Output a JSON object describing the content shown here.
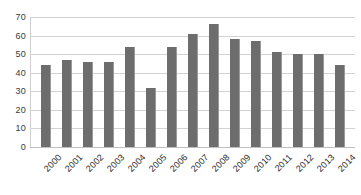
{
  "chart_data": {
    "type": "bar",
    "title": "",
    "subtitle": "",
    "xlabel": "",
    "ylabel": "",
    "categories": [
      "2000",
      "2001",
      "2002",
      "2003",
      "2004",
      "2005",
      "2006",
      "2007",
      "2008",
      "2009",
      "2010",
      "2011",
      "2012",
      "2013",
      "2014"
    ],
    "values": [
      44,
      47,
      46,
      46,
      54,
      32,
      54,
      61,
      66,
      58,
      57,
      51,
      50,
      50,
      44
    ],
    "series": [
      {
        "name": "",
        "values": [
          44,
          47,
          46,
          46,
          54,
          32,
          54,
          61,
          66,
          58,
          57,
          51,
          50,
          50,
          44
        ]
      }
    ],
    "ylim": [
      0,
      70
    ],
    "ytick_labels": [
      "70",
      "60",
      "50",
      "40",
      "30",
      "20",
      "10",
      "0"
    ],
    "ytick_values": [
      70,
      60,
      50,
      40,
      30,
      20,
      10,
      0
    ],
    "grid": true,
    "grid_axis": "y",
    "legend": false,
    "legend_position": "none",
    "annotations": [],
    "bar_color": "#6d6d6d",
    "grid_color": "#d3d3d3",
    "background_color": "#ffffff",
    "axis_text_color": "#2d2d2d",
    "xtick_rotation": -45
  }
}
